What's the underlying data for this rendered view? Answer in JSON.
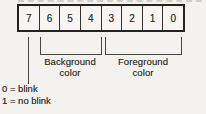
{
  "diagram": {
    "title_semantic": "attribute-byte-bit-layout",
    "bits": [
      "7",
      "6",
      "5",
      "4",
      "3",
      "2",
      "1",
      "0"
    ],
    "background_field": {
      "line1": "Background",
      "line2": "color"
    },
    "foreground_field": {
      "line1": "Foreground",
      "line2": "color"
    },
    "blink_legend": {
      "line1": "0 = blink",
      "line2": "1 = no blink"
    }
  },
  "colors": {
    "ink": "#2f2d2a",
    "paper": "#f4f2ef",
    "box_border": "#25231f",
    "artifact_line": "#ccc9c4"
  }
}
